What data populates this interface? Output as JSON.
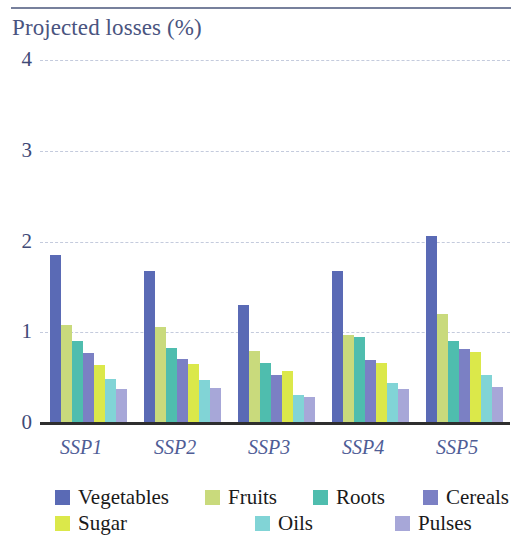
{
  "chart_data": {
    "type": "bar",
    "title": "Projected losses (%)",
    "xlabel": "",
    "ylabel": "",
    "ylim": [
      0,
      4
    ],
    "yticks": [
      "0",
      "1",
      "2",
      "3",
      "4"
    ],
    "grid": true,
    "legend_position": "bottom",
    "categories": [
      "SSP1",
      "SSP2",
      "SSP3",
      "SSP4",
      "SSP5"
    ],
    "series": [
      {
        "name": "Vegetables",
        "color": "#5a6ab5",
        "values": [
          1.85,
          1.68,
          1.3,
          1.68,
          2.06
        ]
      },
      {
        "name": "Fruits",
        "color": "#c9da7c",
        "values": [
          1.08,
          1.06,
          0.79,
          0.97,
          1.2
        ]
      },
      {
        "name": "Roots",
        "color": "#4fbdae",
        "values": [
          0.9,
          0.83,
          0.66,
          0.95,
          0.9
        ]
      },
      {
        "name": "Cereals",
        "color": "#7b80c4",
        "values": [
          0.77,
          0.7,
          0.53,
          0.69,
          0.82
        ]
      },
      {
        "name": "Sugar",
        "color": "#dbe84a",
        "values": [
          0.64,
          0.65,
          0.57,
          0.66,
          0.78
        ]
      },
      {
        "name": "Oils",
        "color": "#81d4d6",
        "values": [
          0.48,
          0.47,
          0.31,
          0.44,
          0.53
        ]
      },
      {
        "name": "Pulses",
        "color": "#a7a7d8",
        "values": [
          0.37,
          0.39,
          0.29,
          0.37,
          0.4
        ]
      }
    ]
  },
  "chart": {
    "title": "Projected losses (%)",
    "yticks": [
      "4",
      "3",
      "2",
      "1",
      "0"
    ],
    "xticks": [
      "SSP1",
      "SSP2",
      "SSP3",
      "SSP4",
      "SSP5"
    ],
    "legend": [
      {
        "label": "Vegetables",
        "color": "#5a6ab5"
      },
      {
        "label": "Fruits",
        "color": "#c9da7c"
      },
      {
        "label": "Roots",
        "color": "#4fbdae"
      },
      {
        "label": "Cereals",
        "color": "#7b80c4"
      },
      {
        "label": "Sugar",
        "color": "#dbe84a"
      },
      {
        "label": "Oils",
        "color": "#81d4d6"
      },
      {
        "label": "Pulses",
        "color": "#a7a7d8"
      }
    ],
    "colors": {
      "title": "#4a5480",
      "axis_text": "#3f4a77",
      "xtick_text": "#4f5d96",
      "gridline": "#c4cbdd",
      "baseline": "#2e2e2e",
      "rule": "#77809c"
    }
  }
}
